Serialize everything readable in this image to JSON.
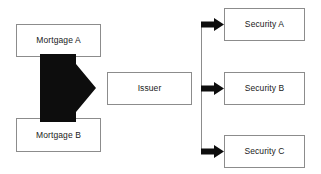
{
  "diagram": {
    "background_color": "#ffffff",
    "box_border_color": "#8c8c8c",
    "arrow_color": "#0d0d0d",
    "text_color": "#1a1a1a",
    "sources": [
      {
        "id": "mortgage-a",
        "label": "Mortgage A"
      },
      {
        "id": "mortgage-b",
        "label": "Mortgage B"
      }
    ],
    "intermediary": {
      "id": "issuer",
      "label": "Issuer"
    },
    "outputs": [
      {
        "id": "security-a",
        "label": "Security A"
      },
      {
        "id": "security-b",
        "label": "Security B"
      },
      {
        "id": "security-c",
        "label": "Security C"
      }
    ],
    "connectors": {
      "pooling_arrow": "thick-right-arrow",
      "distribution_arrows": [
        "right-arrow",
        "right-arrow",
        "right-arrow"
      ],
      "distribution_bus": "vertical-line"
    }
  }
}
